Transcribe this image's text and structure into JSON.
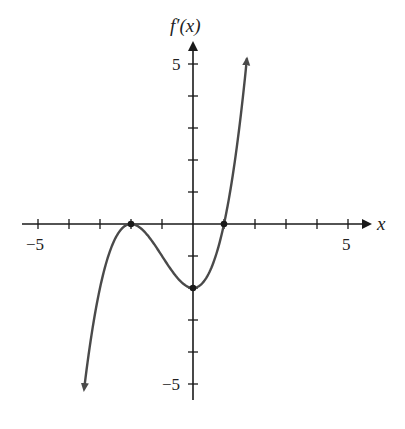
{
  "chart_data": {
    "type": "line",
    "title": "",
    "xlabel": "x",
    "ylabel": "f'(x)",
    "xlim": [
      -5.5,
      5.8
    ],
    "ylim": [
      -5.8,
      5.8
    ],
    "x_ticks": [
      -5,
      -4,
      -3,
      -2,
      -1,
      1,
      2,
      3,
      4,
      5
    ],
    "y_ticks": [
      -5,
      -4,
      -3,
      -2,
      -1,
      1,
      2,
      3,
      4,
      5
    ],
    "x_tick_labels": [
      {
        "value": -5,
        "label": "−5"
      },
      {
        "value": 5,
        "label": "5"
      }
    ],
    "y_tick_labels": [
      {
        "value": 5,
        "label": "5"
      },
      {
        "value": -5,
        "label": "−5"
      }
    ],
    "grid": false,
    "legend": null,
    "series": [
      {
        "name": "f'(x)",
        "formula": "0.5*(x+2)^2*(x-1)",
        "x": [
          -3.5,
          -3.0,
          -2.5,
          -2.0,
          -1.5,
          -1.0,
          -0.5,
          0.0,
          0.5,
          1.0,
          1.5,
          1.74
        ],
        "y": [
          -5.63,
          -2.0,
          -0.44,
          0.0,
          -0.31,
          -1.0,
          -1.69,
          -2.0,
          -1.56,
          0.0,
          3.06,
          5.18
        ],
        "arrows": "both ends"
      }
    ],
    "marked_points": [
      {
        "x": -2,
        "y": 0,
        "note": "local max, tangent to x-axis"
      },
      {
        "x": 0,
        "y": -2,
        "note": "local min on y-axis"
      },
      {
        "x": 1,
        "y": 0,
        "note": "x-intercept"
      }
    ]
  },
  "labels": {
    "y_axis": "f′(x)",
    "x_axis": "x",
    "x_min": "−5",
    "x_max": "5",
    "y_max": "5",
    "y_min": "−5"
  },
  "colors": {
    "axis": "#1a1a1a",
    "curve": "#4a4a4a",
    "background": "#ffffff"
  }
}
